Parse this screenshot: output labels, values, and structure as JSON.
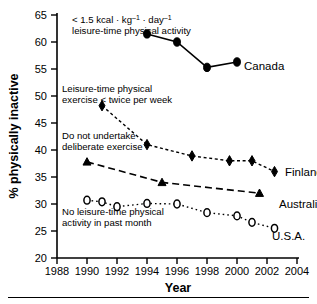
{
  "figure": {
    "background_color": "#ffffff",
    "foreground_color": "#000000",
    "bottom_rule": true
  },
  "chart_data": {
    "type": "line",
    "title": "",
    "subtitle": "",
    "xlabel": "Year",
    "ylabel": "% physically inactive",
    "xlim": [
      1988,
      2004
    ],
    "ylim": [
      20,
      65
    ],
    "xticks": [
      1988,
      1990,
      1992,
      1994,
      1996,
      1998,
      2000,
      2002,
      2004
    ],
    "xtick_labels": [
      "1988",
      "1990",
      "1992",
      "1994",
      "1996",
      "1998",
      "2000",
      "2002",
      "2004"
    ],
    "yticks": [
      20,
      25,
      30,
      35,
      40,
      45,
      50,
      55,
      60,
      65
    ],
    "ytick_labels": [
      "20",
      "25",
      "30",
      "35",
      "40",
      "45",
      "50",
      "55",
      "60",
      "65"
    ],
    "grid": false,
    "legend_position": "inline-right-of-series",
    "series": [
      {
        "name": "Canada",
        "label": "Canada",
        "marker": "filled-circle",
        "linestyle": "solid",
        "x": [
          1994,
          1996,
          1998,
          2000
        ],
        "values": [
          61.5,
          60.0,
          55.3,
          56.3
        ],
        "annotation": "< 1.5 kcal · kg⁻¹ · day⁻¹ leisure-time physical activity"
      },
      {
        "name": "Finland",
        "label": "Finland",
        "marker": "filled-diamond",
        "linestyle": "dotted-dashed",
        "x": [
          1991,
          1994,
          1997,
          1999.5,
          2001,
          2002.5
        ],
        "values": [
          48.2,
          41.0,
          38.9,
          38.0,
          38.0,
          36.0
        ],
        "annotation": "Leisure-time physical exercise < twice per week"
      },
      {
        "name": "Australia",
        "label": "Australia",
        "marker": "filled-triangle",
        "linestyle": "dashed",
        "x": [
          1990,
          1995,
          2001.5
        ],
        "values": [
          37.8,
          34.0,
          32.0
        ],
        "annotation": "Do not undertake deliberate exercise"
      },
      {
        "name": "U.S.A.",
        "label": "U.S.A.",
        "marker": "open-circle",
        "linestyle": "dotted",
        "x": [
          1990,
          1991,
          1992,
          1994,
          1996,
          1998,
          2000,
          2001,
          2002.5
        ],
        "values": [
          30.7,
          30.4,
          29.5,
          30.1,
          30.0,
          28.4,
          27.8,
          26.6,
          25.5
        ],
        "annotation": "No leisure-time physical activity in past month"
      }
    ],
    "annotations": [
      {
        "id": "canada-annotation",
        "line1_prefix": "< 1.5 kcal · kg",
        "line1_sup1": "–1",
        "line1_mid": " · day",
        "line1_sup2": "–1",
        "line2": "leisure-time physical activity"
      },
      {
        "id": "finland-annotation",
        "line1": "Leisure-time physical",
        "line2": "exercise < twice per week"
      },
      {
        "id": "australia-annotation",
        "line1": "Do not undertake",
        "line2": "deliberate exercise"
      },
      {
        "id": "usa-annotation",
        "line1": "No leisure-time physical",
        "line2": "activity in past month"
      }
    ]
  }
}
